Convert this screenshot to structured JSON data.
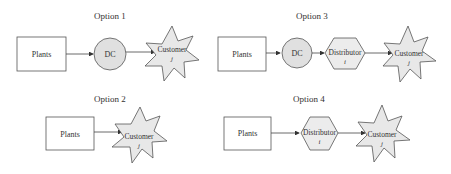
{
  "options": [
    {
      "title": "Option 1",
      "nodes": {
        "plants": "Plants",
        "dc": "DC",
        "customer": "Customer",
        "customer_sub": "j"
      }
    },
    {
      "title": "Option 2",
      "nodes": {
        "plants": "Plants",
        "customer": "Customer",
        "customer_sub": "j"
      }
    },
    {
      "title": "Option 3",
      "nodes": {
        "plants": "Plants",
        "dc": "DC",
        "distributor": "Distributor",
        "distributor_sub": "i",
        "customer": "Customer",
        "customer_sub": "j"
      }
    },
    {
      "title": "Option 4",
      "nodes": {
        "plants": "Plants",
        "distributor": "Distributor",
        "distributor_sub": "i",
        "customer": "Customer",
        "customer_sub": "j"
      }
    }
  ],
  "colors": {
    "stroke": "#555555",
    "fill_shape": "#e6e6e6",
    "fill_box": "#ffffff",
    "text": "#333333"
  }
}
